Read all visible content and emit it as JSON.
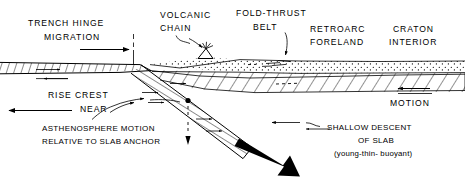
{
  "figure": {
    "background_color": "#ffffff",
    "line_color": "#000000",
    "width": 465,
    "height": 194
  },
  "labels": {
    "trench_hinge_line1": "TRENCH HINGE",
    "trench_hinge_line2": "MIGRATION",
    "volcanic_line1": "VOLCANIC",
    "volcanic_line2": "CHAIN",
    "fold_thrust_line1": "FOLD-THRUST",
    "fold_thrust_line2": "BELT",
    "retroarc_line1": "RETROARC",
    "retroarc_line2": "FORELAND",
    "craton_line1": "CRATON",
    "craton_line2": "INTERIOR",
    "rise_crest": "RISE CREST",
    "near": "NEAR",
    "asthenosphere_line1": "ASTHENOSPHERE  MOTION",
    "asthenosphere_line2": "RELATIVE TO SLAB ANCHOR",
    "motion": "MOTION",
    "shallow_line1": "SHALLOW  DESCENT",
    "shallow_line2": "OF  SLAB",
    "shallow_line3": "(young-thin- buoyant)"
  },
  "icons": {
    "volcano": "volcano-icon",
    "slab_arrow": "thick-slab-descent-arrow-icon",
    "hinge_arrow": "trench-hinge-migration-arrow-icon",
    "rise_arrow": "rise-crest-near-arrow-icon",
    "motion_arrow": "plate-motion-arrow-icon",
    "asthenosphere_arrow": "asthenosphere-motion-arrow-icon",
    "fold_thrust_pointer": "fold-thrust-belt-pointer-icon",
    "volcanic_pointer": "volcanic-chain-pointer-icon",
    "shallow_pointer": "shallow-descent-pointer-icon",
    "hinge_marker": "trench-hinge-dashed-marker-icon",
    "anchor_marker": "slab-anchor-dashed-marker-icon"
  },
  "layers": {
    "oceanic_lithosphere": "oceanic-lithosphere-hatched-band",
    "continental_crust": "continental-crust-stippled-layer",
    "continental_lithosphere": "continental-lithosphere-hatched-layer",
    "subducting_slab": "subducting-slab-hatched-band"
  }
}
